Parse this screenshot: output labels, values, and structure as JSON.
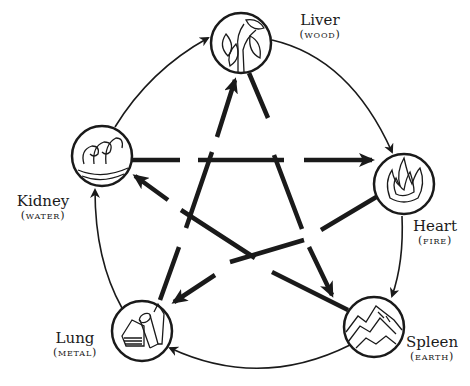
{
  "nodes": [
    {
      "id": "liver",
      "organ": "Liver",
      "element": "(wood)",
      "icon": "leaves-icon"
    },
    {
      "id": "heart",
      "organ": "Heart",
      "element": "(fire)",
      "icon": "flame-icon"
    },
    {
      "id": "spleen",
      "organ": "Spleen",
      "element": "(earth)",
      "icon": "mountain-icon"
    },
    {
      "id": "lung",
      "organ": "Lung",
      "element": "(metal)",
      "icon": "metal-ingots-icon"
    },
    {
      "id": "kidney",
      "organ": "Kidney",
      "element": "(water)",
      "icon": "waves-icon"
    }
  ],
  "generating_cycle": [
    "liver→heart",
    "heart→spleen",
    "spleen→lung",
    "lung→kidney",
    "kidney→liver"
  ],
  "controlling_cycle": [
    "liver→spleen",
    "spleen→kidney",
    "kidney→heart",
    "heart→lung",
    "lung→liver"
  ],
  "colors": {
    "ink": "#1a1a1a",
    "background": "#ffffff"
  }
}
